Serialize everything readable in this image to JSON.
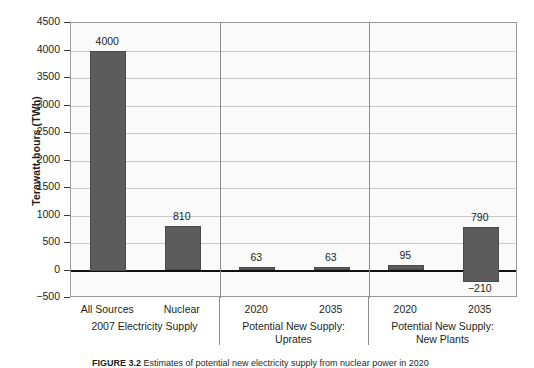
{
  "chart_data": {
    "type": "bar",
    "title": "",
    "xlabel": "",
    "ylabel": "Terawatt-hours (TWh)",
    "ylim": [
      -500,
      4500
    ],
    "ytick_step": 500,
    "grid": true,
    "legend": "none",
    "categories": [
      "All Sources",
      "Nuclear",
      "2020",
      "2035",
      "2020",
      "2035"
    ],
    "values": [
      4000,
      810,
      63,
      63,
      95,
      790
    ],
    "value_labels": [
      "4000",
      "810",
      "63",
      "63",
      "95",
      "790"
    ],
    "bar_bases": [
      0,
      0,
      0,
      0,
      0,
      -210
    ],
    "extra_labels": [
      {
        "for_bar": 5,
        "text": "−210",
        "value": -210,
        "position": "below"
      }
    ],
    "groups": [
      {
        "label": "2007 Electricity Supply",
        "label_lines": [
          "2007 Electricity Supply"
        ],
        "bars": [
          0,
          1
        ]
      },
      {
        "label": "Potential New Supply: Uprates",
        "label_lines": [
          "Potential New Supply:",
          "Uprates"
        ],
        "bars": [
          2,
          3
        ]
      },
      {
        "label": "Potential New Supply: New Plants",
        "label_lines": [
          "Potential New Supply:",
          "New Plants"
        ],
        "bars": [
          4,
          5
        ]
      }
    ],
    "ytick_labels": [
      "4500",
      "4000",
      "3500",
      "3000",
      "2500",
      "2000",
      "1500",
      "1000",
      "500",
      "0",
      "−500"
    ],
    "ytick_values": [
      4500,
      4000,
      3500,
      3000,
      2500,
      2000,
      1500,
      1000,
      500,
      0,
      -500
    ],
    "colors": {
      "bar_fill": "#5c5c5c",
      "bar_stroke": "#4a4a4a",
      "plot_background": "#fafafa",
      "gridline": "#c8c8c8",
      "zero_line": "#111111",
      "axis": "#9a9a9a",
      "text": "#231f20"
    }
  },
  "caption": {
    "label": "FIGURE 3.2",
    "text": "Estimates of potential new electricity supply from nuclear power in 2020"
  }
}
